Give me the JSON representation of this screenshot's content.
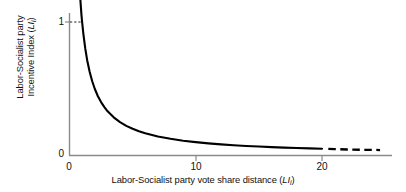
{
  "chart_data": {
    "type": "line",
    "title": "",
    "xlabel": "Labor-Socialist party vote share distance (LIi)",
    "ylabel": "Labor-Socialist party Incentive Index (LIi)",
    "ylabel_line1": "Labor-Socialist party",
    "ylabel_line2": "Incentive Index (LIi)",
    "xlabel_text": "Labor-Socialist party vote share distance (",
    "xlabel_var1": "LI",
    "xlabel_var2": "i",
    "xlabel_close": ")",
    "ylabel_var1": "LI",
    "ylabel_var2": "i",
    "x_ticks": [
      0,
      10,
      20
    ],
    "x_tick_labels": [
      "0",
      "10",
      "20"
    ],
    "y_ticks": [
      0,
      1
    ],
    "y_tick_labels": [
      "0",
      "1"
    ],
    "xlim": [
      0,
      25.5
    ],
    "ylim": [
      0,
      1.1
    ],
    "grid": false,
    "legend": null,
    "relation": "y = 1 / x",
    "series": [
      {
        "name": "Incentive Index",
        "style": "solid",
        "color": "#000000",
        "x": [
          0.78,
          0.85,
          0.95,
          1.0,
          1.1,
          1.25,
          1.4,
          1.6,
          1.8,
          2.0,
          2.25,
          2.5,
          2.75,
          3.0,
          3.5,
          4.0,
          4.5,
          5.0,
          5.5,
          6.0,
          7.0,
          8.0,
          9.0,
          10.0,
          11.0,
          12.0,
          13.0,
          14.0,
          15.0,
          16.0,
          17.0,
          18.0,
          19.0,
          20.0
        ],
        "y": [
          1.28,
          1.18,
          1.05,
          1.0,
          0.91,
          0.8,
          0.714,
          0.625,
          0.556,
          0.5,
          0.444,
          0.4,
          0.364,
          0.333,
          0.286,
          0.25,
          0.222,
          0.2,
          0.182,
          0.167,
          0.143,
          0.125,
          0.111,
          0.1,
          0.091,
          0.083,
          0.077,
          0.071,
          0.067,
          0.063,
          0.059,
          0.056,
          0.053,
          0.05
        ]
      },
      {
        "name": "Incentive Index (extrapolated)",
        "style": "dashed",
        "color": "#000000",
        "x": [
          20.5,
          21.0,
          22.0,
          23.0,
          24.0,
          24.6
        ],
        "y": [
          0.049,
          0.048,
          0.045,
          0.043,
          0.042,
          0.041
        ]
      }
    ],
    "annotations": [
      {
        "name": "unit-leader",
        "style": "dashed",
        "description": "dashed horizontal leader from y=1 tick to curve",
        "from": [
          0.0,
          1.0
        ],
        "to": [
          0.95,
          1.0
        ]
      }
    ],
    "colors": {
      "curve": "#000000",
      "axis": "#8a8a8a",
      "text": "#111111",
      "background": "#ffffff"
    }
  }
}
